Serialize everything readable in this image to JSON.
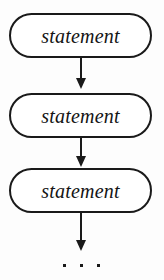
{
  "diagram": {
    "background_color": "#fdfdfd",
    "stroke_color": "#1a1a1a",
    "fill_color": "#ffffff",
    "nodes": [
      {
        "id": "statement-1",
        "label": "statement",
        "shape": "stadium",
        "x": 9,
        "y": 13,
        "width": 143,
        "height": 45
      },
      {
        "id": "statement-2",
        "label": "statement",
        "shape": "stadium",
        "x": 9,
        "y": 93,
        "width": 143,
        "height": 45
      },
      {
        "id": "statement-3",
        "label": "statement",
        "shape": "stadium",
        "x": 9,
        "y": 168,
        "width": 143,
        "height": 45
      }
    ],
    "edges": [
      {
        "id": "edge-1",
        "from": "statement-1",
        "to": "statement-2",
        "x": 80,
        "y": 57,
        "length": 32,
        "arrow": "down"
      },
      {
        "id": "edge-2",
        "from": "statement-2",
        "to": "statement-3",
        "x": 80,
        "y": 136,
        "length": 31,
        "arrow": "down"
      },
      {
        "id": "edge-3",
        "from": "statement-3",
        "to": "ellipsis",
        "x": 80,
        "y": 212,
        "length": 39,
        "arrow": "down"
      }
    ],
    "ellipsis": {
      "id": "ellipsis",
      "label": "...",
      "dot_count": 3,
      "x": 63,
      "y": 263,
      "width": 37
    }
  }
}
